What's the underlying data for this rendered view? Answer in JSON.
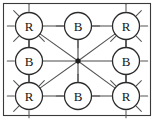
{
  "diagram": {
    "type": "node-link-graph",
    "frame": {
      "visible": true,
      "color": "#3a3a3a"
    },
    "colors": {
      "node_fill": "#ffffff",
      "node_stroke": "#2b2b2b",
      "edge": "#4a4a4a",
      "hub": "#1c1c1c",
      "label": "#141414",
      "background": "#ffffff"
    },
    "nodes": [
      {
        "id": "n-top-left",
        "label": "R",
        "cx": 29,
        "cy": 26,
        "r": 13.5,
        "row": 0,
        "col": 0
      },
      {
        "id": "n-top-center",
        "label": "B",
        "cx": 78,
        "cy": 26,
        "r": 13.5,
        "row": 0,
        "col": 1
      },
      {
        "id": "n-top-right",
        "label": "R",
        "cx": 126,
        "cy": 26,
        "r": 13.5,
        "row": 0,
        "col": 2
      },
      {
        "id": "n-middle-left",
        "label": "B",
        "cx": 29,
        "cy": 61,
        "r": 13.5,
        "row": 1,
        "col": 0
      },
      {
        "id": "n-middle-right",
        "label": "B",
        "cx": 126,
        "cy": 61,
        "r": 13.5,
        "row": 1,
        "col": 2
      },
      {
        "id": "n-bottom-left",
        "label": "R",
        "cx": 29,
        "cy": 96,
        "r": 13.5,
        "row": 2,
        "col": 0
      },
      {
        "id": "n-bottom-center",
        "label": "B",
        "cx": 78,
        "cy": 96,
        "r": 13.5,
        "row": 2,
        "col": 1
      },
      {
        "id": "n-bottom-right",
        "label": "R",
        "cx": 126,
        "cy": 96,
        "r": 13.5,
        "row": 2,
        "col": 2
      }
    ],
    "hub": {
      "id": "n-center-hub",
      "label": "",
      "cx": 78,
      "cy": 61,
      "r": 2.2
    },
    "edges": [
      {
        "from": "n-top-left",
        "to": "n-top-center",
        "kind": "horizontal"
      },
      {
        "from": "n-top-center",
        "to": "n-top-right",
        "kind": "horizontal"
      },
      {
        "from": "n-bottom-left",
        "to": "n-bottom-center",
        "kind": "horizontal"
      },
      {
        "from": "n-bottom-center",
        "to": "n-bottom-right",
        "kind": "horizontal"
      },
      {
        "from": "n-top-left",
        "to": "n-middle-left",
        "kind": "vertical"
      },
      {
        "from": "n-middle-left",
        "to": "n-bottom-left",
        "kind": "vertical"
      },
      {
        "from": "n-top-right",
        "to": "n-middle-right",
        "kind": "vertical"
      },
      {
        "from": "n-middle-right",
        "to": "n-bottom-right",
        "kind": "vertical"
      },
      {
        "from": "n-middle-left",
        "to": "n-center-hub",
        "kind": "horizontal"
      },
      {
        "from": "n-middle-right",
        "to": "n-center-hub",
        "kind": "horizontal"
      },
      {
        "from": "n-top-center",
        "to": "n-center-hub",
        "kind": "vertical"
      },
      {
        "from": "n-bottom-center",
        "to": "n-center-hub",
        "kind": "vertical"
      },
      {
        "from": "n-top-left",
        "to": "n-center-hub",
        "kind": "diagonal"
      },
      {
        "from": "n-top-right",
        "to": "n-center-hub",
        "kind": "diagonal"
      },
      {
        "from": "n-bottom-left",
        "to": "n-center-hub",
        "kind": "diagonal"
      },
      {
        "from": "n-bottom-right",
        "to": "n-center-hub",
        "kind": "diagonal"
      }
    ],
    "stub_ticks": {
      "description": "short outward tick marks radiating from node rims",
      "length": 7,
      "nodes": {
        "n-top-left": [
          180,
          225,
          270,
          315,
          135,
          90
        ],
        "n-top-center": [
          270,
          180,
          0
        ],
        "n-top-right": [
          270,
          315,
          0,
          45,
          225,
          90
        ],
        "n-middle-left": [
          180,
          270,
          90
        ],
        "n-middle-right": [
          0,
          270,
          90
        ],
        "n-bottom-left": [
          180,
          135,
          90,
          45,
          225,
          270
        ],
        "n-bottom-center": [
          90,
          180,
          0
        ],
        "n-bottom-right": [
          0,
          45,
          90,
          135,
          315,
          270
        ]
      }
    }
  }
}
